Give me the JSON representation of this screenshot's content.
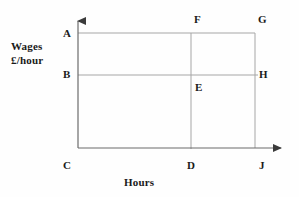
{
  "diagram": {
    "type": "labour-market-wage-hours-rectangle-diagram",
    "axes": {
      "y_title_line1": "Wages",
      "y_title_line2": "£/hour",
      "x_title": "Hours",
      "line_color": "#9a9a9a",
      "axis_color": "#6b6b6b",
      "label_color": "#1a1a1a",
      "background": "#fefefe"
    },
    "points": {
      "A": "A",
      "B": "B",
      "C": "C",
      "D": "D",
      "E": "E",
      "F": "F",
      "G": "G",
      "H": "H",
      "J": "J"
    }
  }
}
